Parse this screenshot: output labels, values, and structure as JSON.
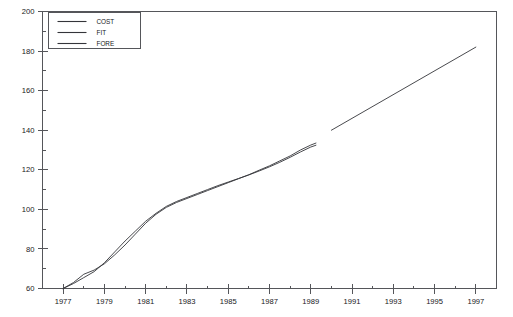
{
  "chart_data": {
    "type": "line",
    "title": "",
    "xlabel": "",
    "ylabel": "",
    "xlim": [
      1976,
      1998
    ],
    "ylim": [
      60,
      200
    ],
    "grid": false,
    "legend_position": "top-left",
    "y_ticks_major": [
      60,
      80,
      100,
      120,
      140,
      160,
      180,
      200
    ],
    "y_ticks_minor": [
      70,
      90,
      110,
      130,
      150,
      170,
      190
    ],
    "x_ticks_major": [
      1977,
      1979,
      1981,
      1983,
      1985,
      1987,
      1989,
      1991,
      1993,
      1995,
      1997
    ],
    "x_ticks_minor": [
      1978,
      1980,
      1982,
      1984,
      1986,
      1988,
      1990,
      1992,
      1994,
      1996
    ],
    "series": [
      {
        "name": "COST",
        "x": [
          1977.0,
          1977.5,
          1978.0,
          1978.5,
          1979.0,
          1979.5,
          1980.0,
          1980.5,
          1981.0,
          1981.5,
          1982.0,
          1982.5,
          1983.0,
          1983.5,
          1984.0,
          1984.5,
          1985.0,
          1985.5,
          1986.0,
          1986.5,
          1987.0,
          1987.5,
          1988.0,
          1988.5,
          1989.0,
          1989.25
        ],
        "values": [
          60.0,
          63.0,
          67.2,
          69.3,
          72.5,
          77.0,
          82.0,
          87.5,
          93.0,
          97.5,
          101.0,
          103.5,
          105.5,
          107.5,
          109.5,
          111.5,
          113.5,
          115.5,
          117.5,
          119.8,
          122.0,
          124.5,
          127.0,
          130.0,
          132.5,
          133.5
        ]
      },
      {
        "name": "FIT",
        "x": [
          1977.0,
          1977.5,
          1978.0,
          1978.5,
          1979.0,
          1979.5,
          1980.0,
          1980.5,
          1981.0,
          1981.5,
          1982.0,
          1982.5,
          1983.0,
          1983.5,
          1984.0,
          1984.5,
          1985.0,
          1985.5,
          1986.0,
          1986.5,
          1987.0,
          1987.5,
          1988.0,
          1988.5,
          1989.0,
          1989.25
        ],
        "values": [
          60.0,
          62.5,
          65.5,
          68.5,
          73.0,
          78.5,
          84.0,
          89.0,
          94.0,
          98.0,
          101.5,
          104.0,
          106.0,
          108.0,
          110.0,
          112.0,
          113.8,
          115.6,
          117.4,
          119.4,
          121.5,
          123.8,
          126.3,
          129.0,
          131.5,
          132.4
        ]
      },
      {
        "name": "FORE",
        "x": [
          1990.0,
          1997.0
        ],
        "values": [
          140.0,
          182.0
        ]
      }
    ]
  },
  "legend": {
    "entries": [
      {
        "label": "COST"
      },
      {
        "label": "FIT"
      },
      {
        "label": "FORE"
      }
    ]
  },
  "colors": {
    "line": "#34353a",
    "axis": "#55565a",
    "text": "#17181a",
    "background": "#ffffff"
  }
}
